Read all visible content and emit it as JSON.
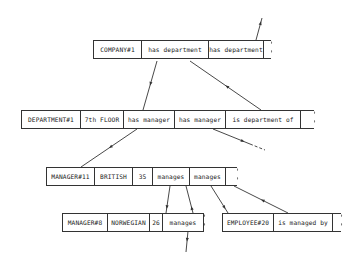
{
  "records": [
    {
      "id": "company",
      "cells": [
        "COMPANY#1",
        "has department",
        "has department"
      ],
      "x": 93,
      "y": 40,
      "widths": [
        48,
        67,
        55
      ],
      "tail": 7
    },
    {
      "id": "department",
      "cells": [
        "DEPARTMENT#1",
        "7th FLOOR",
        "has manager",
        "has manager",
        "is department of"
      ],
      "x": 21,
      "y": 110,
      "widths": [
        59,
        43,
        51,
        51,
        75
      ],
      "tail": 13
    },
    {
      "id": "manager11",
      "cells": [
        "MANAGER#11",
        "BRITISH",
        "35",
        "manages",
        "manages"
      ],
      "x": 46,
      "y": 167,
      "widths": [
        48,
        38,
        20,
        37,
        36
      ],
      "tail": 11
    },
    {
      "id": "manager8",
      "cells": [
        "MANAGER#8",
        "NORWEGIAN",
        "26",
        "manages"
      ],
      "x": 62,
      "y": 213,
      "widths": [
        45,
        42,
        13,
        41
      ],
      "tail": 0
    },
    {
      "id": "employee20",
      "cells": [
        "EMPLOYEE#20",
        "is managed by"
      ],
      "x": 222,
      "y": 213,
      "widths": [
        51,
        59
      ],
      "tail": 8
    }
  ],
  "arrows": [
    {
      "from": [
        256,
        40
      ],
      "to": [
        262,
        18
      ],
      "dir": "end"
    },
    {
      "from": [
        157,
        61
      ],
      "to": [
        143,
        110
      ],
      "dir": "mid"
    },
    {
      "from": [
        261,
        110
      ],
      "to": [
        190,
        61
      ],
      "dir": "mid"
    },
    {
      "from": [
        137,
        129
      ],
      "to": [
        81,
        167
      ],
      "dir": "mid"
    },
    {
      "from": [
        213,
        129
      ],
      "to": [
        250,
        144
      ],
      "dir": "end",
      "dashed_to": [
        265,
        150
      ]
    },
    {
      "from": [
        170,
        186
      ],
      "to": [
        166,
        213
      ],
      "dir": "end"
    },
    {
      "from": [
        193,
        213
      ],
      "to": [
        186,
        186
      ],
      "dir": "near_start"
    },
    {
      "from": [
        211,
        186
      ],
      "to": [
        228,
        213
      ],
      "dir": "end"
    },
    {
      "from": [
        288,
        213
      ],
      "to": [
        234,
        186
      ],
      "dir": "mid"
    },
    {
      "from": [
        188,
        231
      ],
      "to": [
        186,
        252
      ],
      "dir": "mid"
    }
  ],
  "colors": {
    "line": "#333333",
    "text": "#1a1a1a",
    "background": "#ffffff"
  }
}
